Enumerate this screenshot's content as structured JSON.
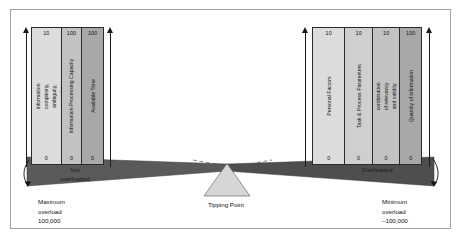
{
  "left_panel": {
    "columns": [
      {
        "top_value": "10",
        "bottom_value": "0",
        "label": "Quality of information – information complexity, ambiguity, uncertainty and novelty (unit 2)"
      },
      {
        "top_value": "100",
        "bottom_value": "0",
        "label": "Information Processing Capacity"
      },
      {
        "top_value": "100",
        "bottom_value": "0",
        "label": "Available Time"
      }
    ]
  },
  "right_panel": {
    "columns": [
      {
        "top_value": "10",
        "bottom_value": "0",
        "label": "Personal Factors"
      },
      {
        "top_value": "10",
        "bottom_value": "0",
        "label": "Task & Process Parameters"
      },
      {
        "top_value": "10",
        "bottom_value": "0",
        "label": "Quality of information – combination of relevancy and validity of information (unit 3)"
      },
      {
        "top_value": "100",
        "bottom_value": "0",
        "label": "Quantity of information"
      }
    ]
  },
  "beam_labels": {
    "left": "Not\noverloaded",
    "left_line1": "Not",
    "left_line2": "overloaded",
    "right": "Overloaded"
  },
  "captions": {
    "left": {
      "line1": "Maximum",
      "line2": "overload",
      "line3": "100,000"
    },
    "center": {
      "line1": "Tipping Point"
    },
    "right": {
      "line1": "Minimum",
      "line2": "overload",
      "line3": "–100,000"
    }
  },
  "colors": {
    "beam_fill": "#5a5a5a",
    "frame": "#9aa2ad",
    "fulcrum": "#d5d5d5",
    "outline": "#2b2b2b"
  }
}
